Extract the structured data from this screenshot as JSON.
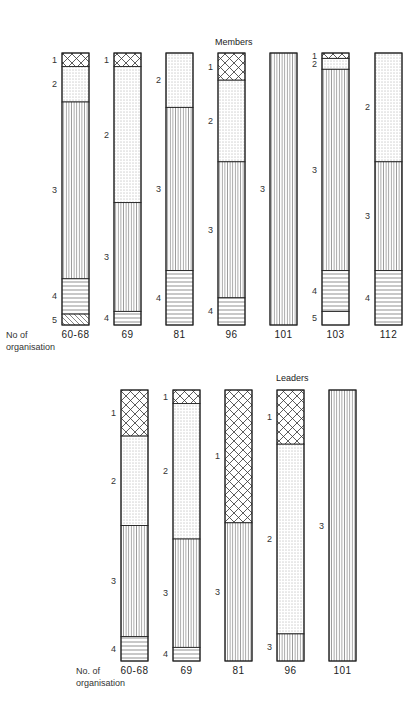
{
  "chart_data": [
    {
      "type": "bar",
      "stacked": true,
      "normalized": true,
      "title": "Members",
      "xlabel": "No of organisation",
      "ylabel": "",
      "ylim": [
        0,
        100
      ],
      "categories": [
        "60-68",
        "69",
        "81",
        "96",
        "101",
        "103",
        "112"
      ],
      "segment_codes": [
        "1",
        "2",
        "3",
        "4",
        "5"
      ],
      "series": [
        {
          "name": "1",
          "pattern": "crosshatch",
          "values": [
            5,
            5,
            0,
            10,
            0,
            2,
            0
          ]
        },
        {
          "name": "2",
          "pattern": "dots",
          "values": [
            13,
            50,
            20,
            30,
            0,
            4,
            40
          ]
        },
        {
          "name": "3",
          "pattern": "vertical-lines",
          "values": [
            65,
            40,
            60,
            50,
            100,
            74,
            40
          ]
        },
        {
          "name": "4",
          "pattern": "horizontal-lines",
          "values": [
            13,
            5,
            20,
            10,
            0,
            15,
            20
          ]
        },
        {
          "name": "5",
          "pattern": "diagonal-lines / blank",
          "values": [
            4,
            0,
            0,
            0,
            0,
            5,
            0
          ]
        }
      ],
      "grid": false,
      "legend": "none (segments labelled 1-5 beside bars)"
    },
    {
      "type": "bar",
      "stacked": true,
      "normalized": true,
      "title": "Leaders",
      "xlabel": "No. of organisation",
      "ylabel": "",
      "ylim": [
        0,
        100
      ],
      "categories": [
        "60-68",
        "69",
        "81",
        "96",
        "101"
      ],
      "segment_codes": [
        "1",
        "2",
        "3",
        "4"
      ],
      "series": [
        {
          "name": "1",
          "pattern": "crosshatch",
          "values": [
            17,
            5,
            49,
            20,
            0
          ]
        },
        {
          "name": "2",
          "pattern": "dots",
          "values": [
            33,
            50,
            0,
            70,
            0
          ]
        },
        {
          "name": "3",
          "pattern": "vertical-lines",
          "values": [
            41,
            40,
            51,
            10,
            100
          ]
        },
        {
          "name": "4",
          "pattern": "horizontal-lines",
          "values": [
            9,
            5,
            0,
            0,
            0
          ]
        }
      ],
      "grid": false,
      "legend": "none (segments labelled 1-4 beside bars)"
    }
  ],
  "members": {
    "title": "Members",
    "axis_label_line1": "No of",
    "axis_label_line2": "organisation",
    "bars": [
      {
        "label": "60-68",
        "segments": [
          {
            "code": "1",
            "pct": 5
          },
          {
            "code": "2",
            "pct": 13
          },
          {
            "code": "3",
            "pct": 65
          },
          {
            "code": "4",
            "pct": 13
          },
          {
            "code": "5",
            "pct": 4
          }
        ]
      },
      {
        "label": "69",
        "segments": [
          {
            "code": "1",
            "pct": 5
          },
          {
            "code": "2",
            "pct": 50
          },
          {
            "code": "3",
            "pct": 40
          },
          {
            "code": "4",
            "pct": 5
          }
        ]
      },
      {
        "label": "81",
        "segments": [
          {
            "code": "2",
            "pct": 20
          },
          {
            "code": "3",
            "pct": 60
          },
          {
            "code": "4",
            "pct": 20
          }
        ]
      },
      {
        "label": "96",
        "segments": [
          {
            "code": "1",
            "pct": 10
          },
          {
            "code": "2",
            "pct": 30
          },
          {
            "code": "3",
            "pct": 50
          },
          {
            "code": "4",
            "pct": 10
          }
        ]
      },
      {
        "label": "101",
        "segments": [
          {
            "code": "3",
            "pct": 100
          }
        ]
      },
      {
        "label": "103",
        "segments": [
          {
            "code": "1",
            "pct": 2
          },
          {
            "code": "2",
            "pct": 4
          },
          {
            "code": "3",
            "pct": 74
          },
          {
            "code": "4",
            "pct": 15
          },
          {
            "code": "5b",
            "pct": 5
          }
        ]
      },
      {
        "label": "112",
        "segments": [
          {
            "code": "2",
            "pct": 40
          },
          {
            "code": "3",
            "pct": 40
          },
          {
            "code": "4",
            "pct": 20
          }
        ]
      }
    ]
  },
  "leaders": {
    "title": "Leaders",
    "axis_label_line1": "No. of",
    "axis_label_line2": "organisation",
    "bars": [
      {
        "label": "60-68",
        "segments": [
          {
            "code": "1",
            "pct": 17
          },
          {
            "code": "2",
            "pct": 33
          },
          {
            "code": "3",
            "pct": 41
          },
          {
            "code": "4",
            "pct": 9
          }
        ]
      },
      {
        "label": "69",
        "segments": [
          {
            "code": "1",
            "pct": 5
          },
          {
            "code": "2",
            "pct": 50
          },
          {
            "code": "3",
            "pct": 40
          },
          {
            "code": "4",
            "pct": 5
          }
        ]
      },
      {
        "label": "81",
        "segments": [
          {
            "code": "1",
            "pct": 49
          },
          {
            "code": "3",
            "pct": 51
          }
        ]
      },
      {
        "label": "96",
        "segments": [
          {
            "code": "1",
            "pct": 20
          },
          {
            "code": "2",
            "pct": 70
          },
          {
            "code": "3",
            "pct": 10
          }
        ]
      },
      {
        "label": "101",
        "segments": [
          {
            "code": "3",
            "pct": 100
          }
        ]
      }
    ]
  },
  "colors": {
    "ink": "#222222",
    "background": "#ffffff"
  }
}
